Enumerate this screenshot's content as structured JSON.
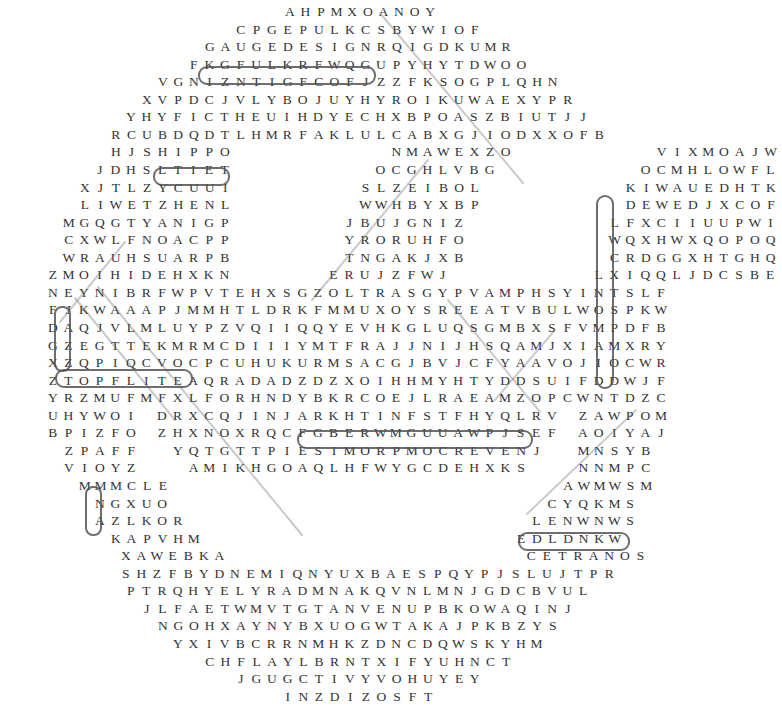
{
  "puzzle": {
    "rows": [
      {
        "y": 18,
        "x0": 282,
        "text": "AHPMXOANOY"
      },
      {
        "y": 41,
        "x0": 233,
        "text": "CPGEPULKCSBYWIOF"
      },
      {
        "y": 63,
        "x0": 202,
        "text": "GAUGEDESIGNRQIGDKUMR"
      },
      {
        "y": 86,
        "x0": 186,
        "text": "FKGFULKRFWQGUPYHYTDWOO"
      },
      {
        "y": 109,
        "x0": 155,
        "text": "VGNIZNTIGFCOFJZZFKSOGPLQHN"
      },
      {
        "y": 131,
        "x0": 139,
        "text": "XVPDCJVLYBOJUYHYROIKUWAEXYPR"
      },
      {
        "y": 153,
        "x0": 123,
        "text": "YHYFICTHEUIHDYECHXBPOASZBIUTJJ"
      },
      {
        "y": 176,
        "x0": 108,
        "text": "RCUBDQDTLHMRFAKLULCABXGJIODXXOFB"
      },
      {
        "y": 198,
        "x0": 108,
        "text": "HJSHIPPO          NMAWEXZO         VIXMOAJW"
      },
      {
        "y": 221,
        "x0": 92,
        "text": "JDHSLTIET         OCGHLVBG         OCMHLOWFL"
      },
      {
        "y": 243,
        "x0": 77,
        "text": "XJTLZYCUUI        SLZEIBOL         KIWAUEDHTK"
      },
      {
        "y": 266,
        "x0": 77,
        "text": "LIWETZHENL        WWHBYXBP         DEWEDJXCOF"
      },
      {
        "y": 288,
        "x0": 61,
        "text": "MGQGTYANIGP       JBUJGNIZ         LFXCIIUUPWI"
      },
      {
        "y": 311,
        "x0": 61,
        "text": "CXWLFNOACPP       YRORUHFO         WQXHWXQOPOQ"
      },
      {
        "y": 333,
        "x0": 61,
        "text": "WRAUHSUARPB       TNGAKJXB         CRDGGXHTGHQ"
      },
      {
        "y": 356,
        "x0": 45,
        "text": "ZMOIHIDEHXKN      ERUJZFWJ         LXIQQLJDCSBE"
      },
      {
        "y": 378,
        "x0": 45,
        "text": "NEYNIBRFWPVTEHXSGZOLTRASGYPVAMPHSYINTSLF"
      },
      {
        "y": 401,
        "x0": 45,
        "text": "FJKWAAAPJMMHTLDRKFMMUXOYSREEATVBULWOSPKW"
      },
      {
        "y": 423,
        "x0": 45,
        "text": "DAQJVLMLUYPZVQIIQQYEVHKGLUQSGMBXSFVMPDFB"
      },
      {
        "y": 446,
        "x0": 45,
        "text": "GZEGTTEKMRMCDIIIYMTFRAJJNIJHSQAMJXIAMXRY"
      },
      {
        "y": 468,
        "x0": 45,
        "text": "XZQPIQCVOCPCUHUKURMSACGJBVJCFYAAVOJIOCWR"
      },
      {
        "y": 491,
        "x0": 45,
        "text": "ZTOPFLITEAQRADADZDZXOIHHMYHTYDDSUIFDDWJF"
      },
      {
        "y": 513,
        "x0": 45,
        "text": "YRZMUFMFXLFORHNDYBKRCOEJLRAEAMZOPCWNTDZC"
      },
      {
        "y": 536,
        "x0": 45,
        "text": "UHYWOI DRXCQJINJARKHTINFSTFHYQLRV ZAWPOM"
      },
      {
        "y": 558,
        "x0": 45,
        "text": "BPIZFO ZHXNOXRQCFGBERWMGUUAWPJSEF AOIYAJ"
      },
      {
        "y": 581,
        "x0": 61,
        "text": "ZPAFF  YQTGTTPIESIMORPMOCREVENJ  MNSYB"
      },
      {
        "y": 603,
        "x0": 61,
        "text": "VIOYZ   AMIKHGOAQLHFWYGCDEHXKS   NNMPC"
      },
      {
        "y": 626,
        "x0": 77,
        "text": "MMMCLE                         AWMWSM"
      },
      {
        "y": 648,
        "x0": 92,
        "text": "NGXUO                        CYQKMS"
      },
      {
        "y": 671,
        "x0": 92,
        "text": "AZLKOR                      LENWNWS"
      },
      {
        "y": 693,
        "x0": 108,
        "text": "KAPVHM                    EDLDNKW"
      }
    ],
    "rows_bottom": [
      {
        "y": 524,
        "x0": 118,
        "text": "XAWEBKA                   CETRANOS"
      },
      {
        "y": 548,
        "x0": 118,
        "text": "SHZFBYDNEMIQNYUXBAESPQYPJSLUJTPR"
      },
      {
        "y": 571,
        "x0": 123,
        "text": "PTRQHYELYRADMNAKQVNLMNJGDCBVUL"
      },
      {
        "y": 594,
        "x0": 139,
        "text": "JLFAETWMVTGTANVENUPBKOWAQINJ"
      },
      {
        "y": 617,
        "x0": 155,
        "text": "NGOHXAYNYBXUOGWTAKAJPKBZYS"
      },
      {
        "y": 640,
        "x0": 170,
        "text": "YXIVBCRRNMHKZDNCDQWSKYHM"
      },
      {
        "y": 663,
        "x0": 202,
        "text": "CHFLAYLBRNTXIFYUHNCT"
      },
      {
        "y": 686,
        "x0": 233,
        "text": "JGUGCTIVYVOHUYEY"
      },
      {
        "y": 708,
        "x0": 280,
        "text": "INZDIZOSFT"
      }
    ],
    "found_words": [
      "GAUGEDESIGN",
      "HIPPO",
      "TOPFLITE",
      "NEVERCOMPROMISE",
      "CETRANOS",
      "HCUOTDNOMAID",
      "JAZZ",
      "GZK"
    ]
  }
}
